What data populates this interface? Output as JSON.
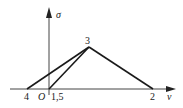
{
  "diagram": {
    "axes": {
      "y_label": "σ",
      "x_label": "v",
      "origin_label": "O"
    },
    "points": {
      "p3": {
        "label": "3",
        "x": 89,
        "y": 47
      },
      "p4": {
        "label": "4",
        "x": 27,
        "y": 89
      },
      "p15": {
        "label": "1,5",
        "x": 49,
        "y": 89
      },
      "p2": {
        "label": "2",
        "x": 153,
        "y": 89
      }
    },
    "edges": [
      {
        "from": "4",
        "to": "3"
      },
      {
        "from": "1,5",
        "to": "3"
      },
      {
        "from": "3",
        "to": "2"
      }
    ],
    "colors": {
      "line": "#1a1a1a",
      "axis": "#444444",
      "background": "#ffffff"
    }
  }
}
